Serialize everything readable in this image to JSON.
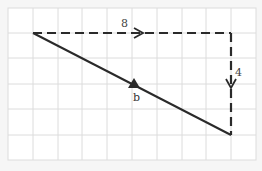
{
  "diagram": {
    "grid": {
      "columns": 10,
      "rows": 6,
      "line_color": "#d8d8d8",
      "background": "#ffffff"
    },
    "vectors": [
      {
        "id": "horizontal",
        "label": "8",
        "style": "dashed",
        "direction": "right"
      },
      {
        "id": "vertical",
        "label": "4",
        "style": "dashed",
        "direction": "down"
      },
      {
        "id": "resultant",
        "label": "b",
        "style": "solid",
        "direction": "down-right"
      }
    ],
    "colors": {
      "stroke": "#2a2a2a"
    }
  }
}
